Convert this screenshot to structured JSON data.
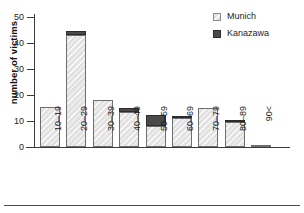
{
  "chart_data": {
    "type": "bar",
    "subtype": "stacked",
    "title": "",
    "xlabel": "",
    "ylabel": "number of victims",
    "categories": [
      "10–19",
      "20–29",
      "30–39",
      "40–49",
      "50–59",
      "60–69",
      "70–79",
      "80–89",
      "90<"
    ],
    "series": [
      {
        "name": "Munich",
        "color": "#e2e2e2",
        "values": [
          15.5,
          43,
          18,
          13.5,
          8,
          11,
          15,
          9.5,
          0.5
        ]
      },
      {
        "name": "Kanazawa",
        "color": "#4a4a4a",
        "values": [
          0,
          1.5,
          0,
          1.5,
          4.5,
          1,
          0,
          1,
          0
        ]
      }
    ],
    "totals": [
      15.5,
      44.5,
      18,
      15,
      12.5,
      12,
      15,
      10.5,
      0.5
    ],
    "ylim": [
      0,
      50
    ],
    "yticks": [
      0,
      10,
      20,
      30,
      40,
      50
    ],
    "ytick_labels": [
      "0",
      "10",
      "20",
      "30",
      "40",
      "50"
    ],
    "grid": false,
    "legend_position": "top-right"
  },
  "legend": {
    "items": [
      {
        "label": "Munich",
        "swatch": "munich"
      },
      {
        "label": "Kanazawa",
        "swatch": "kanazawa"
      }
    ]
  }
}
